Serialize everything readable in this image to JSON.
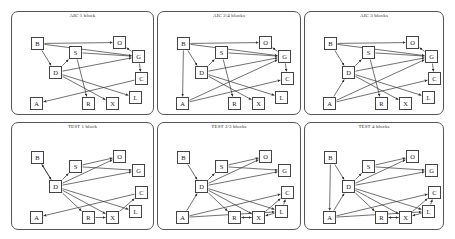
{
  "figure": {
    "panels": [
      {
        "title": "AIC 1 block",
        "x": 11,
        "y": 11,
        "w": 143,
        "h": 104,
        "edges": [
          [
            "B",
            "O"
          ],
          [
            "B",
            "G"
          ],
          [
            "B",
            "D"
          ],
          [
            "D",
            "S"
          ],
          [
            "S",
            "G"
          ],
          [
            "S",
            "R"
          ],
          [
            "D",
            "G"
          ],
          [
            "D",
            "X"
          ],
          [
            "D",
            "L"
          ],
          [
            "G",
            "O"
          ],
          [
            "G",
            "C"
          ],
          [
            "C",
            "A"
          ]
        ]
      },
      {
        "title": "AIC 2/4 blocks",
        "x": 157,
        "y": 11,
        "w": 144,
        "h": 104,
        "edges": [
          [
            "B",
            "O"
          ],
          [
            "B",
            "G"
          ],
          [
            "B",
            "D"
          ],
          [
            "B",
            "A"
          ],
          [
            "D",
            "S"
          ],
          [
            "S",
            "G"
          ],
          [
            "S",
            "R"
          ],
          [
            "D",
            "G"
          ],
          [
            "D",
            "X"
          ],
          [
            "D",
            "L"
          ],
          [
            "G",
            "O"
          ],
          [
            "G",
            "C"
          ],
          [
            "A",
            "G"
          ],
          [
            "A",
            "C"
          ]
        ]
      },
      {
        "title": "AIC 3 blocks",
        "x": 304,
        "y": 11,
        "w": 140,
        "h": 104,
        "edges": [
          [
            "B",
            "O"
          ],
          [
            "B",
            "G"
          ],
          [
            "B",
            "D"
          ],
          [
            "A",
            "D"
          ],
          [
            "D",
            "S"
          ],
          [
            "S",
            "G"
          ],
          [
            "S",
            "R"
          ],
          [
            "D",
            "G"
          ],
          [
            "D",
            "X"
          ],
          [
            "D",
            "L"
          ],
          [
            "G",
            "O"
          ],
          [
            "G",
            "C"
          ],
          [
            "A",
            "G"
          ],
          [
            "A",
            "C"
          ]
        ]
      },
      {
        "title": "TEST 1 block",
        "x": 11,
        "y": 122,
        "w": 143,
        "h": 108,
        "edges": [
          [
            "D",
            "B"
          ],
          [
            "B",
            "D"
          ],
          [
            "D",
            "S"
          ],
          [
            "D",
            "O"
          ],
          [
            "S",
            "G"
          ],
          [
            "S",
            "O"
          ],
          [
            "D",
            "G"
          ],
          [
            "D",
            "R"
          ],
          [
            "D",
            "X"
          ],
          [
            "D",
            "L"
          ],
          [
            "R",
            "X"
          ],
          [
            "X",
            "C"
          ],
          [
            "C",
            "A"
          ]
        ]
      },
      {
        "title": "TEST 2/3 blocks",
        "x": 157,
        "y": 122,
        "w": 144,
        "h": 108,
        "edges": [
          [
            "B",
            "D"
          ],
          [
            "A",
            "D"
          ],
          [
            "D",
            "S"
          ],
          [
            "D",
            "O"
          ],
          [
            "S",
            "G"
          ],
          [
            "S",
            "O"
          ],
          [
            "D",
            "G"
          ],
          [
            "D",
            "R"
          ],
          [
            "D",
            "X"
          ],
          [
            "D",
            "L"
          ],
          [
            "A",
            "C"
          ],
          [
            "A",
            "L"
          ],
          [
            "R",
            "X"
          ],
          [
            "X",
            "R"
          ],
          [
            "X",
            "C"
          ],
          [
            "L",
            "X"
          ],
          [
            "L",
            "C"
          ]
        ]
      },
      {
        "title": "TEST 4 blocks",
        "x": 304,
        "y": 122,
        "w": 140,
        "h": 108,
        "edges": [
          [
            "B",
            "D"
          ],
          [
            "B",
            "A"
          ],
          [
            "A",
            "D"
          ],
          [
            "D",
            "S"
          ],
          [
            "D",
            "O"
          ],
          [
            "S",
            "G"
          ],
          [
            "S",
            "O"
          ],
          [
            "D",
            "G"
          ],
          [
            "D",
            "R"
          ],
          [
            "D",
            "X"
          ],
          [
            "D",
            "L"
          ],
          [
            "A",
            "C"
          ],
          [
            "A",
            "L"
          ],
          [
            "R",
            "X"
          ],
          [
            "X",
            "R"
          ],
          [
            "X",
            "C"
          ],
          [
            "L",
            "X"
          ],
          [
            "L",
            "C"
          ]
        ]
      }
    ],
    "node_positions": {
      "B": [
        19,
        25
      ],
      "S": [
        57,
        34
      ],
      "O": [
        101,
        24
      ],
      "G": [
        120,
        38
      ],
      "D": [
        37,
        54
      ],
      "C": [
        123,
        60
      ],
      "A": [
        18,
        85
      ],
      "R": [
        70,
        85
      ],
      "X": [
        94,
        85
      ],
      "L": [
        117,
        79
      ]
    },
    "node_labels": [
      "B",
      "S",
      "O",
      "G",
      "D",
      "C",
      "A",
      "R",
      "X",
      "L"
    ]
  }
}
